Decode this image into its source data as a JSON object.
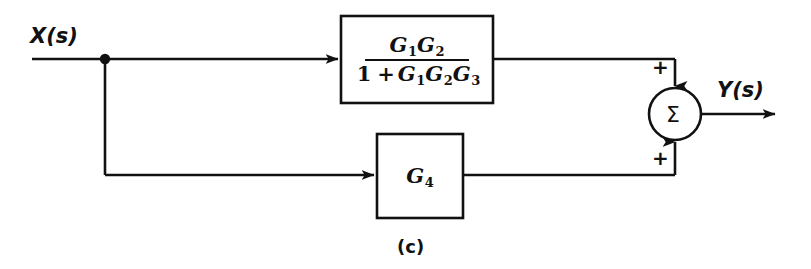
{
  "figure": {
    "caption": "(c)",
    "background_color": "#ffffff",
    "ink_color": "#111111"
  },
  "signals": {
    "input": {
      "name": "X",
      "arg": "(s)",
      "label": "X(s)"
    },
    "output": {
      "name": "Y",
      "arg": "(s)",
      "label": "Y(s)"
    }
  },
  "blocks": {
    "transfer_function": {
      "numerator": {
        "terms": [
          {
            "base": "G",
            "sub": "1"
          },
          {
            "base": "G",
            "sub": "2"
          }
        ],
        "text": "G1G2"
      },
      "denominator": {
        "leading": "1",
        "operator": "+",
        "terms": [
          {
            "base": "G",
            "sub": "1"
          },
          {
            "base": "G",
            "sub": "2"
          },
          {
            "base": "G",
            "sub": "3"
          }
        ],
        "text": "1 + G1G2G3"
      },
      "full_text": "G1G2 / (1 + G1G2G3)"
    },
    "gain": {
      "base": "G",
      "sub": "4",
      "text": "G4"
    }
  },
  "summing_junction": {
    "symbol": "Σ",
    "inputs": [
      {
        "port": "top",
        "sign": "+"
      },
      {
        "port": "bottom",
        "sign": "+"
      }
    ]
  }
}
